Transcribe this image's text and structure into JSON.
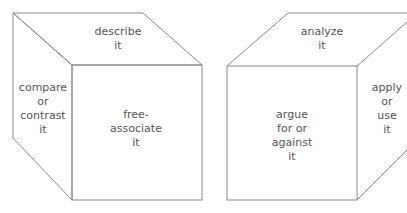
{
  "diagram": {
    "line_color": "#8a8a8a",
    "text_color": "#555555",
    "cubes": [
      {
        "name": "left-cube",
        "faces": {
          "top": "describe\nit",
          "left": "compare\nor\ncontrast\nit",
          "front": "free-\nassociate\nit"
        }
      },
      {
        "name": "right-cube",
        "faces": {
          "top": "analyze\nit",
          "front": "argue\nfor or\nagainst\nit",
          "right": "apply\nor\nuse\nit"
        }
      }
    ]
  }
}
